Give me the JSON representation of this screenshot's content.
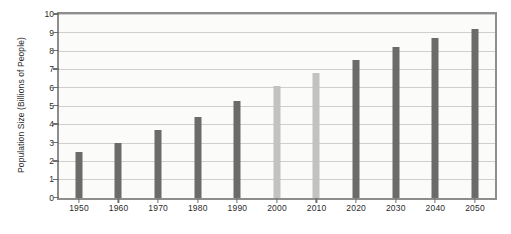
{
  "chart_data": {
    "type": "bar",
    "title": "",
    "subtitle": "",
    "xlabel": "",
    "ylabel": "Population Size (Billions of People)",
    "categories": [
      "1950",
      "1960",
      "1970",
      "1980",
      "1990",
      "2000",
      "2010",
      "2020",
      "2030",
      "2040",
      "2050"
    ],
    "values": [
      2.5,
      3.0,
      3.7,
      4.4,
      5.3,
      6.1,
      6.8,
      7.5,
      8.2,
      8.7,
      9.2
    ],
    "series": [
      {
        "name": "World population",
        "values": [
          2.5,
          3.0,
          3.7,
          4.4,
          5.3,
          6.1,
          6.8,
          7.5,
          8.2,
          8.7,
          9.2
        ]
      }
    ],
    "bar_shades": [
      "dark",
      "dark",
      "dark",
      "dark",
      "dark",
      "light",
      "light",
      "dark",
      "dark",
      "dark",
      "dark"
    ],
    "ylim": [
      0,
      10
    ],
    "y_ticks": [
      0,
      1,
      2,
      3,
      4,
      5,
      6,
      7,
      8,
      9,
      10
    ],
    "y_tick_labels": [
      "0",
      "1",
      "2",
      "3",
      "4",
      "5",
      "6",
      "7",
      "8",
      "9",
      "10"
    ],
    "grid": true,
    "grid_axis": "y",
    "legend": false,
    "legend_position": "none",
    "annotations": [],
    "colors": {
      "bar_dark": "#6b6b6b",
      "bar_light": "#c2c2c2",
      "gridline": "#cfcfcf",
      "axis": "#8d8d8d",
      "text": "#2b2b2b",
      "plot_background": "#fbfbf9",
      "figure_background": "#ffffff"
    }
  }
}
